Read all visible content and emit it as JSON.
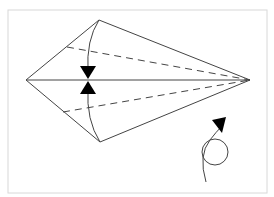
{
  "diagram": {
    "type": "origami-fold-step",
    "colors": {
      "frame": "#d8d8d8",
      "line": "#444444",
      "arrow": "#000000",
      "background": "#ffffff"
    },
    "elements": {
      "kite_outline": "kite-shape",
      "center_crease": "horizontal-crease",
      "fold_lines": [
        "upper-valley-fold",
        "lower-valley-fold"
      ],
      "fold_arrows": [
        "fold-down-arrow",
        "fold-up-arrow"
      ],
      "turn_over_symbol": "turn-over-icon"
    }
  }
}
